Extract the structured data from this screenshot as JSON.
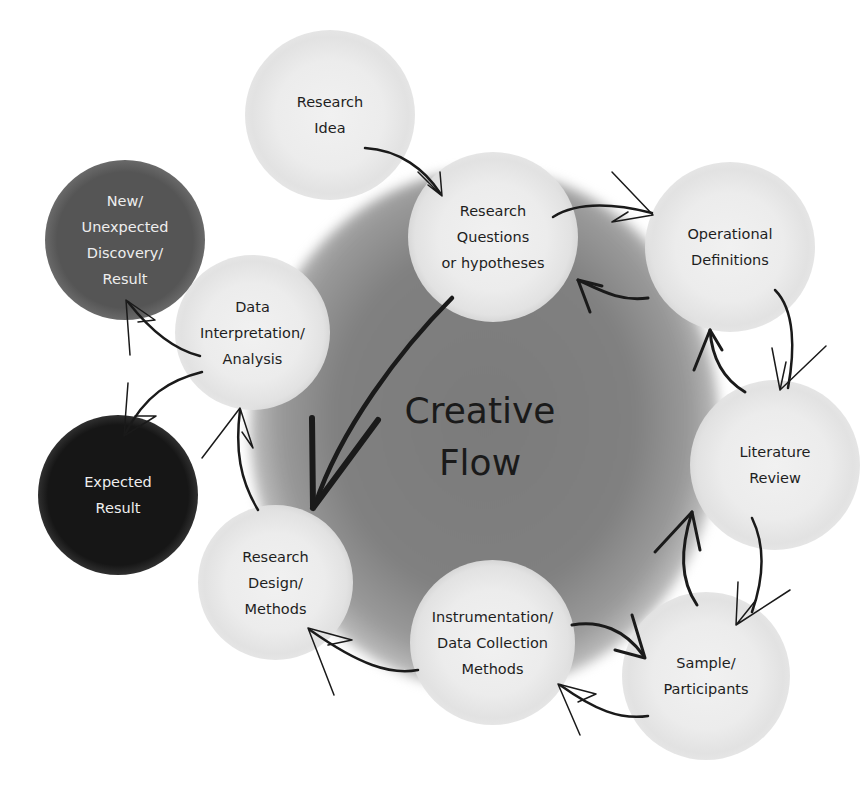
{
  "diagram": {
    "center": {
      "line1": "Creative",
      "line2": "Flow"
    },
    "nodes": [
      {
        "id": "research-idea",
        "label": "Research\nIdea",
        "style": "light"
      },
      {
        "id": "research-questions",
        "label": "Research\nQuestions\nor hypotheses",
        "style": "light"
      },
      {
        "id": "operational-definitions",
        "label": "Operational\nDefinitions",
        "style": "light"
      },
      {
        "id": "literature-review",
        "label": "Literature\nReview",
        "style": "light"
      },
      {
        "id": "sample-participants",
        "label": "Sample/\nParticipants",
        "style": "light"
      },
      {
        "id": "instrumentation",
        "label": "Instrumentation/\nData Collection\nMethods",
        "style": "light"
      },
      {
        "id": "research-design",
        "label": "Research\nDesign/\nMethods",
        "style": "light"
      },
      {
        "id": "data-interpretation",
        "label": "Data\nInterpretation/\nAnalysis",
        "style": "light"
      },
      {
        "id": "new-discovery",
        "label": "New/\nUnexpected\nDiscovery/\nResult",
        "style": "dark"
      },
      {
        "id": "expected-result",
        "label": "Expected\nResult",
        "style": "black"
      }
    ],
    "colors": {
      "node_light": "#ececec",
      "node_dark": "#555555",
      "node_black": "#161616",
      "center": "#808080",
      "arrow": "#1a1a1a"
    }
  }
}
